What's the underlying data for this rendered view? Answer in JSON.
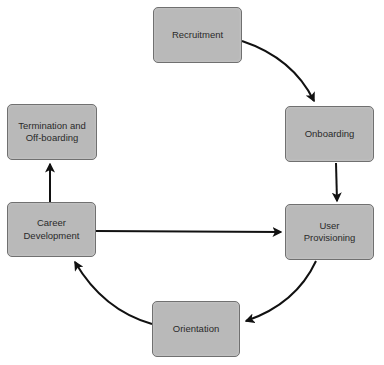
{
  "diagram": {
    "type": "cycle-flowchart",
    "colors": {
      "node_fill": "#b9b9b9",
      "node_border": "#707070",
      "arrow": "#111111",
      "background": "#ffffff",
      "text": "#2a2a2a"
    },
    "nodes": [
      {
        "id": "recruitment",
        "label": "Recruitment"
      },
      {
        "id": "onboarding",
        "label": "Onboarding"
      },
      {
        "id": "user-provisioning",
        "label": "User\nProvisioning"
      },
      {
        "id": "orientation",
        "label": "Orientation"
      },
      {
        "id": "career-development",
        "label": "Career\nDevelopment"
      },
      {
        "id": "termination",
        "label": "Termination and\nOff-boarding"
      }
    ],
    "edges": [
      {
        "from": "recruitment",
        "to": "onboarding",
        "style": "curved"
      },
      {
        "from": "onboarding",
        "to": "user-provisioning",
        "style": "straight"
      },
      {
        "from": "user-provisioning",
        "to": "orientation",
        "style": "curved"
      },
      {
        "from": "orientation",
        "to": "career-development",
        "style": "curved"
      },
      {
        "from": "career-development",
        "to": "user-provisioning",
        "style": "straight"
      },
      {
        "from": "career-development",
        "to": "termination",
        "style": "straight"
      }
    ]
  }
}
